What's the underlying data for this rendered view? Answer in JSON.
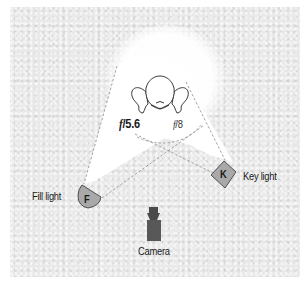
{
  "diagram": {
    "type": "lighting-setup",
    "subject": {
      "icon": "person-top-view-icon"
    },
    "apertures": {
      "left": {
        "prefix": "f",
        "value": "/5.6",
        "weight": "bold"
      },
      "right": {
        "prefix": "f",
        "value": "/8",
        "weight": "normal"
      }
    },
    "lights": [
      {
        "id": "fill",
        "letter": "F",
        "label": "Fill light",
        "shape": "half-round"
      },
      {
        "id": "key",
        "letter": "K",
        "label": "Key light",
        "shape": "diamond"
      }
    ],
    "camera": {
      "label": "Camera"
    },
    "colors": {
      "background": "#e9e9e9",
      "light_cone": "#ffffff",
      "light_fixture": "#a9a9a9",
      "camera": "#555555",
      "dashed_line": "#8a8a8a",
      "text": "#1a1a1a"
    }
  }
}
